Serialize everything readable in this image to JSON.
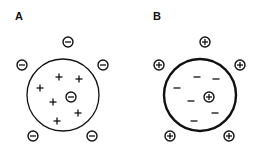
{
  "colors": {
    "stroke": "#111111",
    "background": "#ffffff"
  },
  "panels": [
    {
      "label": "A",
      "label_pos": [
        20,
        20
      ],
      "sphere": {
        "cx": 63,
        "cy": 95,
        "r": 36,
        "stroke_width": 1.3
      },
      "inner_charge_sign": "+",
      "inner_charges": [
        [
          59,
          77
        ],
        [
          79,
          79
        ],
        [
          40,
          88
        ],
        [
          53,
          102
        ],
        [
          78,
          113
        ],
        [
          57,
          121
        ]
      ],
      "center_ion": {
        "sign": "-",
        "pos": [
          71,
          97
        ]
      },
      "outer_ions": {
        "sign": "-",
        "positions": [
          [
            68,
            42
          ],
          [
            22,
            65
          ],
          [
            103,
            65
          ],
          [
            33,
            136
          ],
          [
            92,
            136
          ]
        ]
      }
    },
    {
      "label": "B",
      "label_pos": [
        153,
        20
      ],
      "sphere": {
        "cx": 200,
        "cy": 95,
        "r": 36,
        "stroke_width": 2.4
      },
      "inner_charge_sign": "-",
      "inner_charges": [
        [
          197,
          77
        ],
        [
          216,
          79
        ],
        [
          177,
          88
        ],
        [
          191,
          101
        ],
        [
          215,
          113
        ],
        [
          194,
          121
        ]
      ],
      "center_ion": {
        "sign": "+",
        "pos": [
          209,
          97
        ]
      },
      "outer_ions": {
        "sign": "+",
        "positions": [
          [
            205,
            42
          ],
          [
            159,
            65
          ],
          [
            240,
            65
          ],
          [
            170,
            136
          ],
          [
            229,
            136
          ]
        ]
      }
    }
  ]
}
